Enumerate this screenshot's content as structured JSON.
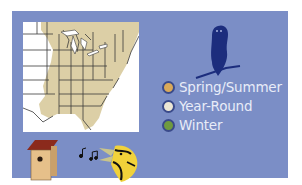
{
  "panel": {
    "background": "#7b8ec6"
  },
  "map": {
    "description": "Range map of eastern United States",
    "fill_color": "#dccfa6",
    "border_color": "#3a3a3a"
  },
  "icons": {
    "owl": "owl-silhouette-icon",
    "birdhouse": "birdhouse-icon",
    "song": "music-notes-icon",
    "bird_head": "singing-bird-head-icon"
  },
  "legend": {
    "items": [
      {
        "label": "Spring/Summer",
        "color": "#d9a95a"
      },
      {
        "label": "Year-Round",
        "color": "#ece6d4"
      },
      {
        "label": "Winter",
        "color": "#6f9a3f"
      }
    ]
  }
}
